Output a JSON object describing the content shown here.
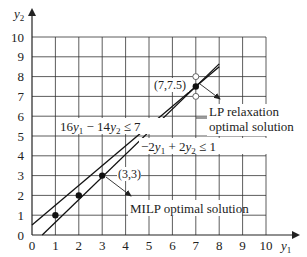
{
  "chart_data": {
    "type": "line",
    "title": "",
    "xlabel": "y1",
    "ylabel": "y2",
    "xlim": [
      0,
      10
    ],
    "ylim": [
      0,
      10
    ],
    "grid": true,
    "x_ticks": [
      0,
      1,
      2,
      3,
      4,
      5,
      6,
      7,
      8,
      9,
      10
    ],
    "y_ticks": [
      0,
      1,
      2,
      3,
      4,
      5,
      6,
      7,
      8,
      9,
      10
    ],
    "series": [
      {
        "name": "16y1 − 14y2 ≤ 7",
        "label_parts": [
          "16",
          "y",
          "1",
          " − 14",
          "y",
          "2",
          " ≤ 7"
        ],
        "x": [
          0.4375,
          8
        ],
        "y": [
          0,
          8.643
        ]
      },
      {
        "name": "−2y1 + 2y2 ≤ 1",
        "label_parts": [
          "−2",
          "y",
          "1",
          " + 2",
          "y",
          "2",
          " ≤ 1"
        ],
        "x": [
          0,
          8
        ],
        "y": [
          0.5,
          8.5
        ]
      }
    ],
    "integer_points": [
      {
        "x": 1,
        "y": 1
      },
      {
        "x": 2,
        "y": 2
      },
      {
        "x": 3,
        "y": 3
      }
    ],
    "lp_point": {
      "x": 7,
      "y": 7.5,
      "label": "(7,7.5)"
    },
    "open_points": [
      {
        "x": 7,
        "y": 8
      },
      {
        "x": 7,
        "y": 7
      }
    ],
    "annotations": [
      {
        "text_lines": [
          "LP relaxation",
          "optimal solution"
        ],
        "points_to": [
          7,
          7.5
        ]
      },
      {
        "text_lines": [
          "MILP optimal solution"
        ],
        "points_to": [
          3,
          3
        ],
        "point_label": "(3,3)"
      }
    ]
  },
  "labels": {
    "y_axis": "y",
    "y_axis_sub": "2",
    "x_axis": "y",
    "x_axis_sub": "1",
    "line1": {
      "a": "16",
      "v1": "y",
      "s1": "1",
      "b": " − 14",
      "v2": "y",
      "s2": "2",
      "c": " ≤ 7"
    },
    "line2": {
      "a": "−2",
      "v1": "y",
      "s1": "1",
      "b": " + 2",
      "v2": "y",
      "s2": "2",
      "c": " ≤ 1"
    },
    "lp_point_label": "(7,7.5)",
    "milp_point_label": "(3,3)",
    "lp_annotation_line1": "LP relaxation",
    "lp_annotation_line2": "optimal solution",
    "milp_annotation": "MILP optimal solution",
    "x_tick_labels": [
      "0",
      "1",
      "2",
      "3",
      "4",
      "5",
      "6",
      "7",
      "8",
      "9",
      "10"
    ],
    "y_tick_labels": [
      "0",
      "1",
      "2",
      "3",
      "4",
      "5",
      "6",
      "7",
      "8",
      "9",
      "10"
    ]
  }
}
